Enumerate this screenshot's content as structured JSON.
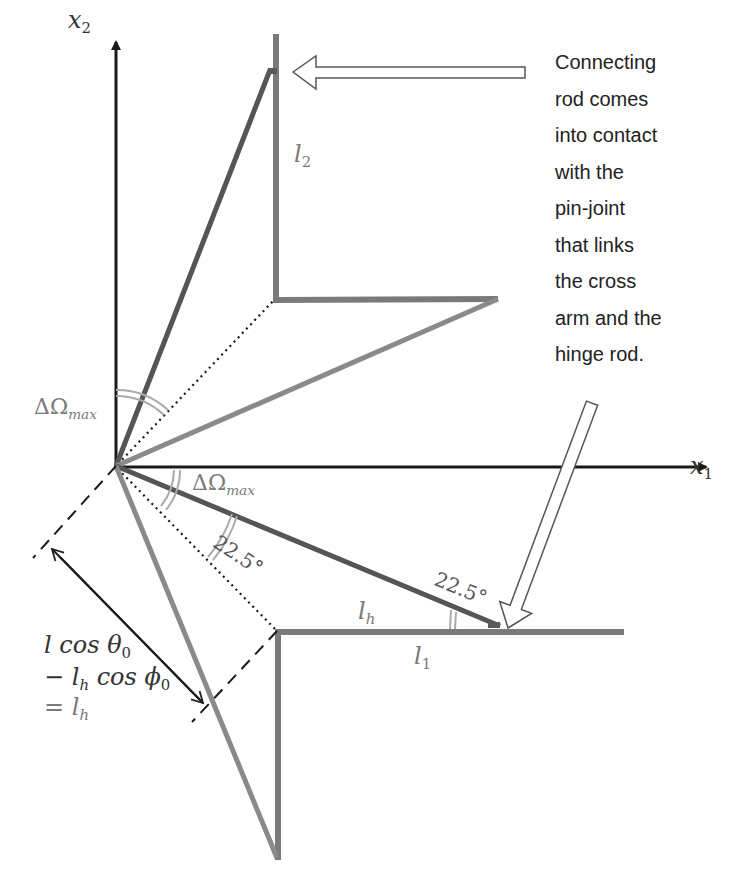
{
  "colors": {
    "axis": "#1a1a1a",
    "dark_rod": "#555555",
    "light_rod": "#8a8a8a",
    "frame_rod": "#7a7a7a",
    "label_gray": "#7a7a7a",
    "label_dark": "#333333",
    "background": "#ffffff"
  },
  "axes": {
    "x1": {
      "name": "x",
      "sub": "1"
    },
    "x2": {
      "name": "x",
      "sub": "2"
    }
  },
  "labels": {
    "l2": {
      "name": "l",
      "sub": "2"
    },
    "l1": {
      "name": "l",
      "sub": "1"
    },
    "lh": {
      "name": "l",
      "sub": "h"
    },
    "delta_omega_upper": {
      "prefix": "ΔΩ",
      "sub": "max"
    },
    "delta_omega_lower": {
      "prefix": "ΔΩ",
      "sub": "max"
    },
    "angle_lower": "22.5°",
    "angle_right": "22.5°",
    "formula": {
      "line1": "l cos θ",
      "line1_sub": "0",
      "line2_prefix": "− l",
      "line2_sub1": "h",
      "line2_mid": " cos ϕ",
      "line2_sub2": "0",
      "line3_prefix": "= l",
      "line3_sub": "h"
    }
  },
  "caption": {
    "lines": [
      "Connecting",
      "rod comes",
      "into contact",
      "with the",
      "pin-joint",
      "that links",
      "the cross",
      "arm and the",
      "hinge rod."
    ]
  },
  "geometry": {
    "origin": [
      116,
      466
    ],
    "x1_axis_end": [
      708,
      467
    ],
    "x2_axis_top": [
      116,
      40
    ],
    "upper_frame": {
      "top": [
        276,
        34
      ],
      "corner": [
        275,
        300
      ],
      "right": [
        498,
        299
      ]
    },
    "lower_frame": {
      "bottom": [
        278,
        860
      ],
      "corner": [
        277,
        631
      ],
      "right": [
        624,
        632
      ]
    },
    "upper_dark_rod_tip": [
      270,
      70
    ],
    "lower_dark_rod_tip": [
      500,
      626
    ],
    "upper_light_rod_tip": [
      498,
      299
    ],
    "lower_light_rod_tip": [
      278,
      860
    ]
  }
}
